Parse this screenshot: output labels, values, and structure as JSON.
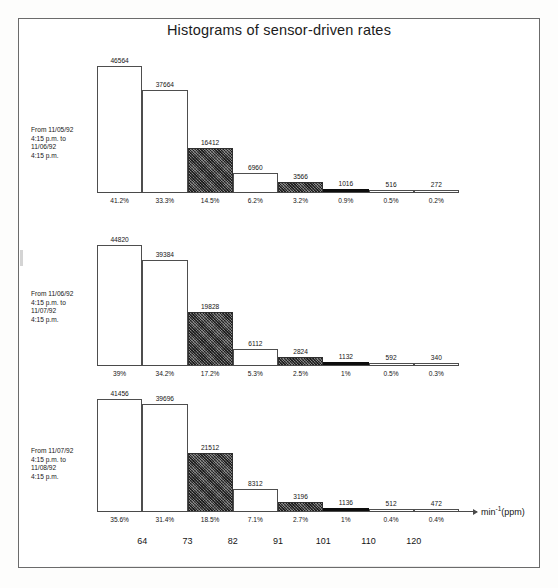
{
  "figure": {
    "title": "Histograms of sensor-driven rates",
    "axis_unit_base": "min",
    "axis_unit_exponent": "-1",
    "axis_unit_suffix": "(ppm)"
  },
  "chart_data": [
    {
      "type": "bar",
      "title": "From 11/05/92 4:15 p.m. to 11/06/92 4:15 p.m.",
      "caption": "From 11/05/92\n4:15 p.m. to\n11/06/92\n4:15 p.m.",
      "xlabel": "min-1(ppm)",
      "ylabel": "",
      "categories": [
        "64",
        "73",
        "82",
        "91",
        "101",
        "110",
        "120",
        ""
      ],
      "values": [
        46564,
        37664,
        16412,
        6960,
        3566,
        1016,
        516,
        272
      ],
      "value_labels": [
        "46564",
        "37664",
        "16412",
        "6960",
        "3566",
        "1016",
        "516",
        "272"
      ],
      "percent_labels": [
        "41.2%",
        "33.3%",
        "14.5%",
        "6.2%",
        "3.2%",
        "0.9%",
        "0.5%",
        "0.2%"
      ],
      "percents": [
        41.2,
        33.3,
        14.5,
        6.2,
        3.2,
        0.9,
        0.5,
        0.2
      ],
      "bar_styles": [
        "open",
        "open",
        "hatched",
        "open",
        "hatched",
        "solid",
        "open",
        "open"
      ],
      "ylim": [
        0,
        46564
      ],
      "grid": false,
      "legend": "none"
    },
    {
      "type": "bar",
      "title": "From 11/06/92 4:15 p.m. to 11/07/92 4:15 p.m.",
      "caption": "From 11/06/92\n4:15 p.m. to\n11/07/92\n4:15 p.m.",
      "xlabel": "min-1(ppm)",
      "ylabel": "",
      "categories": [
        "64",
        "73",
        "82",
        "91",
        "101",
        "110",
        "120",
        ""
      ],
      "values": [
        44820,
        39384,
        19828,
        6112,
        2824,
        1132,
        592,
        340
      ],
      "value_labels": [
        "44820",
        "39384",
        "19828",
        "6112",
        "2824",
        "1132",
        "592",
        "340"
      ],
      "percent_labels": [
        "39%",
        "34.2%",
        "17.2%",
        "5.3%",
        "2.5%",
        "1%",
        "0.5%",
        "0.3%"
      ],
      "percents": [
        39,
        34.2,
        17.2,
        5.3,
        2.5,
        1,
        0.5,
        0.3
      ],
      "bar_styles": [
        "open",
        "open",
        "hatched",
        "open",
        "hatched",
        "solid",
        "open",
        "open"
      ],
      "ylim": [
        0,
        44820
      ],
      "grid": false,
      "legend": "none"
    },
    {
      "type": "bar",
      "title": "From 11/07/92 4:15 p.m. to 11/08/92 4:15 p.m.",
      "caption": "From 11/07/92\n4:15 p.m. to\n11/08/92\n4:15 p.m.",
      "xlabel": "min-1(ppm)",
      "ylabel": "",
      "categories": [
        "64",
        "73",
        "82",
        "91",
        "101",
        "110",
        "120",
        ""
      ],
      "values": [
        41456,
        39696,
        21512,
        8312,
        3196,
        1136,
        512,
        472
      ],
      "value_labels": [
        "41456",
        "39696",
        "21512",
        "8312",
        "3196",
        "1136",
        "512",
        "472"
      ],
      "percent_labels": [
        "35.6%",
        "31.4%",
        "18.5%",
        "7.1%",
        "2.7%",
        "1%",
        "0.4%",
        "0.4%"
      ],
      "percents": [
        35.6,
        31.4,
        18.5,
        7.1,
        2.7,
        1,
        0.4,
        0.4
      ],
      "bar_styles": [
        "open",
        "open",
        "hatched",
        "open",
        "hatched",
        "solid",
        "open",
        "open"
      ],
      "ylim": [
        0,
        41456
      ],
      "grid": false,
      "legend": "none"
    }
  ],
  "xaxis": {
    "ticks": [
      "64",
      "73",
      "82",
      "91",
      "101",
      "110",
      "120"
    ]
  }
}
